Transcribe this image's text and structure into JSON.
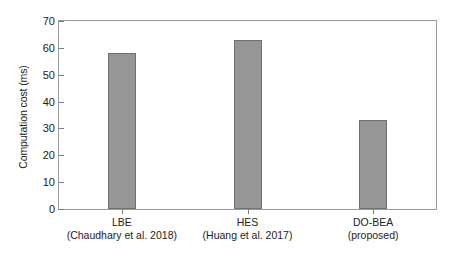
{
  "chart_data": {
    "type": "bar",
    "title": "",
    "xlabel": "",
    "ylabel": "Computation cost (ms)",
    "categories": [
      "LBE",
      "HES",
      "DO-BEA"
    ],
    "category_sublabels": [
      "(Chaudhary et al. 2018)",
      "(Huang et al. 2017)",
      "(proposed)"
    ],
    "values": [
      58,
      63,
      33
    ],
    "ylim": [
      0,
      70
    ],
    "yticks": [
      0,
      10,
      20,
      30,
      40,
      50,
      60,
      70
    ],
    "ytick_labels": [
      "0",
      "10",
      "20",
      "30",
      "40",
      "50",
      "60",
      "70"
    ],
    "grid": false,
    "legend": false,
    "bar_color": "#969696",
    "bar_edge_color": "#6f6f6f",
    "axis_color": "#9a9a9a",
    "background": "#ffffff"
  }
}
